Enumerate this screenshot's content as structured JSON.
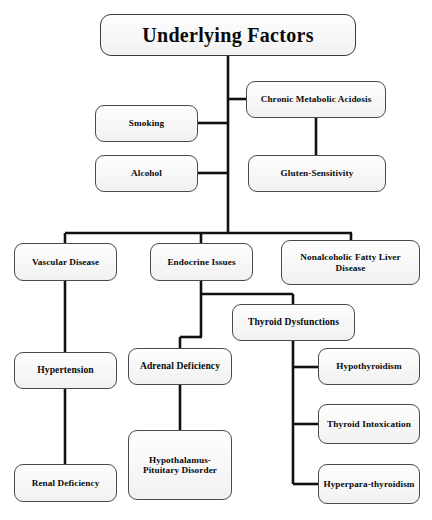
{
  "diagram": {
    "title": "Underlying Factors",
    "type": "flowchart",
    "orientation": "top-down",
    "root": {
      "id": "root",
      "label": "Underlying Factors"
    },
    "nodes": [
      {
        "id": "root",
        "label": "Underlying Factors",
        "level": 0,
        "x": 100,
        "y": 14,
        "w": 256,
        "h": 42
      },
      {
        "id": "cma",
        "label": "Chronic Metabolic Acidosis",
        "level": 1,
        "x": 246,
        "y": 81,
        "w": 140,
        "h": 37
      },
      {
        "id": "smoking",
        "label": "Smoking",
        "level": 1,
        "x": 95,
        "y": 105,
        "w": 103,
        "h": 37
      },
      {
        "id": "alcohol",
        "label": "Alcohol",
        "level": 1,
        "x": 95,
        "y": 155,
        "w": 103,
        "h": 37
      },
      {
        "id": "gluten",
        "label": "Gluten-Sensitivity",
        "level": 2,
        "x": 248,
        "y": 155,
        "w": 138,
        "h": 37
      },
      {
        "id": "vascular",
        "label": "Vascular Disease",
        "level": 1,
        "x": 14,
        "y": 243,
        "w": 103,
        "h": 38
      },
      {
        "id": "endocrine",
        "label": "Endocrine Issues",
        "level": 1,
        "x": 150,
        "y": 243,
        "w": 103,
        "h": 38
      },
      {
        "id": "nafld",
        "label": "Nonalcoholic Fatty Liver Disease",
        "level": 1,
        "x": 281,
        "y": 240,
        "w": 139,
        "h": 45
      },
      {
        "id": "thyroiddys",
        "label": "Thyroid Dysfunctions",
        "level": 2,
        "x": 232,
        "y": 304,
        "w": 123,
        "h": 37
      },
      {
        "id": "hypertension",
        "label": "Hypertension",
        "level": 2,
        "x": 14,
        "y": 352,
        "w": 103,
        "h": 37
      },
      {
        "id": "adrenal",
        "label": "Adrenal Deficiency",
        "level": 2,
        "x": 128,
        "y": 348,
        "w": 104,
        "h": 37
      },
      {
        "id": "hypothyroid",
        "label": "Hypothyroidism",
        "level": 3,
        "x": 318,
        "y": 348,
        "w": 102,
        "h": 37
      },
      {
        "id": "thyrointox",
        "label": "Thyroid Intoxication",
        "level": 3,
        "x": 318,
        "y": 404,
        "w": 102,
        "h": 40
      },
      {
        "id": "hyperpara",
        "label": "Hyperpara-thyroidism",
        "level": 3,
        "x": 318,
        "y": 464,
        "w": 102,
        "h": 40
      },
      {
        "id": "hypopit",
        "label": "Hypothalamus-Pituitary Disorder",
        "level": 3,
        "x": 128,
        "y": 430,
        "w": 104,
        "h": 70
      },
      {
        "id": "renal",
        "label": "Renal Deficiency",
        "level": 3,
        "x": 14,
        "y": 464,
        "w": 103,
        "h": 38
      }
    ],
    "edges": [
      {
        "from": "root",
        "to": "cma"
      },
      {
        "from": "root",
        "to": "smoking"
      },
      {
        "from": "root",
        "to": "alcohol"
      },
      {
        "from": "cma",
        "to": "gluten"
      },
      {
        "from": "root",
        "to": "vascular"
      },
      {
        "from": "root",
        "to": "endocrine"
      },
      {
        "from": "root",
        "to": "nafld"
      },
      {
        "from": "vascular",
        "to": "hypertension"
      },
      {
        "from": "hypertension",
        "to": "renal"
      },
      {
        "from": "endocrine",
        "to": "adrenal"
      },
      {
        "from": "endocrine",
        "to": "thyroiddys"
      },
      {
        "from": "adrenal",
        "to": "hypopit"
      },
      {
        "from": "thyroiddys",
        "to": "hypothyroid"
      },
      {
        "from": "thyroiddys",
        "to": "thyrointox"
      },
      {
        "from": "thyroiddys",
        "to": "hyperpara"
      }
    ],
    "colors": {
      "node_border": "#4a4a4a",
      "node_fill": "#f7f7f7",
      "connector": "#111111",
      "text": "#0a0a0a",
      "background": "#ffffff"
    }
  }
}
